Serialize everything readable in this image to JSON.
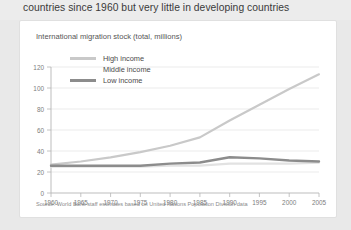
{
  "headline": "countries since 1960 but very little in developing countries",
  "card": {
    "subtitle": "International migration stock (total, millions)",
    "source": "Source: World Bank staff estimates based on United Nations Population Division data"
  },
  "legend": [
    {
      "label": "High income",
      "color": "#c9c9c9",
      "swatch": true
    },
    {
      "label": "Middle income",
      "color": "#e2e2e2",
      "swatch": false
    },
    {
      "label": "Low income",
      "color": "#8c8c8c",
      "swatch": true
    }
  ],
  "chart_data": {
    "type": "line",
    "title": "",
    "subtitle": "International migration stock (total, millions)",
    "xlabel": "",
    "ylabel": "",
    "x": [
      1960,
      1965,
      1970,
      1975,
      1980,
      1985,
      1990,
      1995,
      2000,
      2005
    ],
    "categories": [
      "1960",
      "1965",
      "1970",
      "1975",
      "1980",
      "1985",
      "1990",
      "1995",
      "2000",
      "2005"
    ],
    "xlim": [
      1960,
      2005
    ],
    "ylim": [
      0,
      120
    ],
    "yticks": [
      0,
      20,
      40,
      60,
      80,
      100,
      120
    ],
    "ytick_labels": [
      "0",
      "20",
      "40",
      "60",
      "80",
      "100",
      "120"
    ],
    "grid": true,
    "legend_position": "top-left",
    "series": [
      {
        "name": "High income",
        "color": "#c9c9c9",
        "values": [
          27,
          30,
          34,
          39,
          45,
          53,
          69,
          84,
          99,
          113
        ]
      },
      {
        "name": "Middle income",
        "color": "#e2e2e2",
        "values": [
          25,
          25,
          25,
          25,
          26,
          26,
          28,
          28,
          28,
          29
        ]
      },
      {
        "name": "Low income",
        "color": "#8c8c8c",
        "values": [
          26,
          26,
          26,
          26,
          28,
          29,
          34,
          33,
          31,
          30
        ]
      }
    ]
  },
  "axis": {
    "y_ticks": [
      "120",
      "100",
      "80",
      "60",
      "40",
      "20",
      "0"
    ],
    "x_ticks": [
      "1960",
      "1965",
      "1970",
      "1975",
      "1980",
      "1985",
      "1990",
      "1995",
      "2000",
      "2005"
    ]
  }
}
